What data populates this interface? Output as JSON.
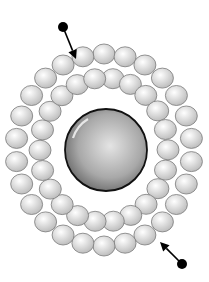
{
  "diagram": {
    "title": "",
    "canvas": {
      "width": 209,
      "height": 282,
      "background": "#ffffff"
    },
    "core_sphere": {
      "label": "central-sphere",
      "cx": 106,
      "cy": 150,
      "r": 41,
      "fill_light": "#e4e4e4",
      "fill_mid": "#a8a8a8",
      "fill_dark": "#5a5a5a",
      "stroke": "#111111"
    },
    "bead_rings": {
      "center": {
        "cx": 104,
        "cy": 150
      },
      "bead_fill_light": "#ffffff",
      "bead_fill_dark": "#b9b9b9",
      "bead_stroke": "#7a7a7a",
      "rings": [
        {
          "name": "outer-ring",
          "rx": 88,
          "ry": 96,
          "count": 26,
          "bead_rx": 11,
          "bead_ry": 10,
          "start_deg": -90
        },
        {
          "name": "inner-ring",
          "rx": 64,
          "ry": 72,
          "count": 22,
          "bead_rx": 11,
          "bead_ry": 10,
          "start_deg": -82
        }
      ]
    },
    "arrows": [
      {
        "name": "incoming-arrow-top",
        "ball": {
          "x": 63,
          "y": 27,
          "r": 5
        },
        "tip": {
          "x": 76,
          "y": 59
        },
        "color": "#000000"
      },
      {
        "name": "incoming-arrow-bottom",
        "ball": {
          "x": 182,
          "y": 264,
          "r": 5
        },
        "tip": {
          "x": 160,
          "y": 242
        },
        "color": "#000000"
      }
    ]
  }
}
